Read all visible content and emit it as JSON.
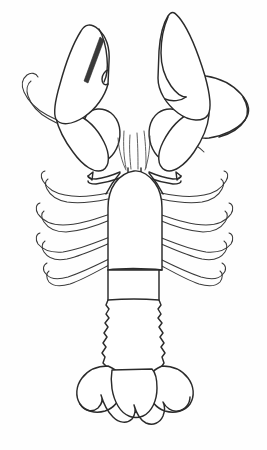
{
  "figure": {
    "kind": "scientific-line-drawing",
    "view": "dorsal",
    "caption": "",
    "background_color": "#fefefe",
    "ink_color": "#2b2b2b",
    "width": 267,
    "height": 450
  },
  "anatomy": {
    "parts": [
      {
        "id": "left-cheliped-claw",
        "label": "left cheliped claw",
        "side": "left"
      },
      {
        "id": "left-cheliped-carpus",
        "label": "left cheliped carpus",
        "side": "left"
      },
      {
        "id": "left-cheliped-merus",
        "label": "left cheliped merus",
        "side": "left"
      },
      {
        "id": "right-cheliped-claw",
        "label": "right cheliped claw",
        "side": "right"
      },
      {
        "id": "right-cheliped-carpus",
        "label": "right cheliped carpus",
        "side": "right"
      },
      {
        "id": "right-cheliped-merus",
        "label": "right cheliped merus",
        "side": "right"
      },
      {
        "id": "left-antenna",
        "label": "left antenna flagellum",
        "side": "left"
      },
      {
        "id": "right-antenna",
        "label": "right antenna flagellum",
        "side": "right"
      },
      {
        "id": "left-antennal-scale",
        "label": "left antennal scale",
        "side": "left"
      },
      {
        "id": "right-antennal-scale",
        "label": "right antennal scale",
        "side": "right"
      },
      {
        "id": "rostrum",
        "label": "rostrum",
        "side": "center"
      },
      {
        "id": "antennules",
        "label": "antennules",
        "side": "center"
      },
      {
        "id": "left-eye",
        "label": "left eye",
        "side": "left"
      },
      {
        "id": "right-eye",
        "label": "right eye",
        "side": "right"
      },
      {
        "id": "carapace",
        "label": "carapace",
        "side": "center"
      },
      {
        "id": "cervical-groove",
        "label": "cervical groove",
        "side": "center"
      },
      {
        "id": "abdomen",
        "label": "abdomen",
        "side": "center"
      },
      {
        "id": "telson",
        "label": "telson",
        "side": "center"
      },
      {
        "id": "uropods",
        "label": "uropods / tail fan",
        "side": "center"
      }
    ],
    "walking_legs": {
      "label": "walking legs (pereiopods)",
      "count_per_side": 4,
      "sides": [
        "left",
        "right"
      ]
    },
    "abdominal_segments": {
      "label": "abdominal segments",
      "count": 6
    }
  }
}
